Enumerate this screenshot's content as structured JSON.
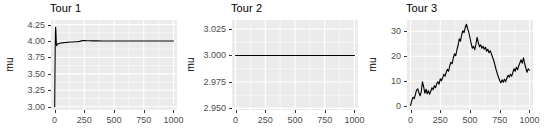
{
  "figure": {
    "width": 546,
    "height": 135,
    "panel_bg": "#ebebeb",
    "grid_color": "#ffffff",
    "line_color": "#000000",
    "text_color": "#000000",
    "tick_text_color": "#4d4d4d"
  },
  "panels": [
    {
      "id": "tour-1",
      "title": "Tour 1",
      "ylabel": "mu",
      "xlabel": "",
      "geom": {
        "left": 51,
        "top": 20,
        "width": 126,
        "height": 90
      },
      "title_left": 50,
      "ylabel_center_x": 9,
      "chart_data": {
        "type": "line",
        "title": "Tour 1",
        "xlabel": "",
        "ylabel": "mu",
        "xlim": [
          -30,
          1030
        ],
        "ylim": [
          2.95,
          4.32
        ],
        "xticks": [
          0,
          250,
          500,
          750,
          1000
        ],
        "xtick_labels": [
          "0",
          "250",
          "500",
          "750",
          "1000"
        ],
        "yticks": [
          3.0,
          3.25,
          3.5,
          3.75,
          4.0,
          4.25
        ],
        "ytick_labels": [
          "3.00",
          "3.25",
          "3.50",
          "3.75",
          "4.00",
          "4.25"
        ],
        "grid": true,
        "minor_grid": true,
        "legend": "none",
        "series": [
          {
            "name": "mu",
            "x": [
              1,
              3,
              5,
              7,
              9,
              11,
              13,
              15,
              18,
              21,
              24,
              27,
              30,
              34,
              38,
              42,
              46,
              50,
              56,
              62,
              70,
              80,
              90,
              100,
              115,
              130,
              150,
              170,
              190,
              210,
              225,
              240,
              255,
              270,
              290,
              320,
              360,
              400,
              450,
              500,
              560,
              620,
              680,
              740,
              800,
              860,
              920,
              970,
              1000
            ],
            "y": [
              3.0,
              3.42,
              3.86,
              4.12,
              4.21,
              4.16,
              4.04,
              3.96,
              3.93,
              3.94,
              3.95,
              3.955,
              3.958,
              3.96,
              3.962,
              3.965,
              3.967,
              3.968,
              3.97,
              3.972,
              3.974,
              3.976,
              3.978,
              3.98,
              3.982,
              3.984,
              3.986,
              3.988,
              3.99,
              3.995,
              4.002,
              4.007,
              4.006,
              4.004,
              4.003,
              4.002,
              4.002,
              4.001,
              4.001,
              4.0,
              4.0,
              4.0,
              4.0,
              4.0,
              4.0,
              4.0,
              4.0,
              4.0,
              4.0
            ]
          }
        ]
      }
    },
    {
      "id": "tour-2",
      "title": "Tour 2",
      "ylabel": "mu",
      "xlabel": "",
      "geom": {
        "left": 232,
        "top": 20,
        "width": 126,
        "height": 90
      },
      "title_left": 231,
      "ylabel_center_x": 190,
      "chart_data": {
        "type": "line",
        "title": "Tour 2",
        "xlabel": "",
        "ylabel": "mu",
        "xlim": [
          -30,
          1030
        ],
        "ylim": [
          2.9485,
          3.0335
        ],
        "xticks": [
          0,
          250,
          500,
          750,
          1000
        ],
        "xtick_labels": [
          "0",
          "250",
          "500",
          "750",
          "1000"
        ],
        "yticks": [
          2.95,
          2.975,
          3.0,
          3.025
        ],
        "ytick_labels": [
          "2.950",
          "2.975",
          "3.000",
          "3.025"
        ],
        "grid": true,
        "minor_grid": true,
        "legend": "none",
        "series": [
          {
            "name": "mu",
            "x": [
              0,
              100,
              200,
              300,
              400,
              500,
              600,
              700,
              800,
              900,
              1000
            ],
            "y": [
              3.0,
              3.0,
              3.0,
              3.0,
              3.0,
              3.0,
              3.0,
              3.0,
              3.0,
              3.0,
              3.0
            ]
          }
        ]
      }
    },
    {
      "id": "tour-3",
      "title": "Tour 3",
      "ylabel": "mu",
      "xlabel": "",
      "geom": {
        "left": 407,
        "top": 20,
        "width": 126,
        "height": 90
      },
      "title_left": 406,
      "ylabel_center_x": 372,
      "chart_data": {
        "type": "line",
        "title": "Tour 3",
        "xlabel": "",
        "ylabel": "mu",
        "xlim": [
          -30,
          1030
        ],
        "ylim": [
          -1.5,
          34.5
        ],
        "xticks": [
          0,
          250,
          500,
          750,
          1000
        ],
        "xtick_labels": [
          "0",
          "250",
          "500",
          "750",
          "1000"
        ],
        "yticks": [
          0,
          10,
          20,
          30
        ],
        "ytick_labels": [
          "0",
          "10",
          "20",
          "30"
        ],
        "grid": true,
        "minor_grid": true,
        "legend": "none",
        "series": [
          {
            "name": "mu",
            "x": [
              0,
              10,
              20,
              30,
              40,
              50,
              60,
              70,
              80,
              90,
              100,
              110,
              120,
              130,
              140,
              150,
              160,
              170,
              180,
              190,
              200,
              210,
              220,
              230,
              240,
              250,
              260,
              270,
              280,
              290,
              300,
              310,
              320,
              330,
              340,
              350,
              360,
              370,
              380,
              390,
              400,
              410,
              420,
              430,
              440,
              450,
              460,
              470,
              480,
              490,
              500,
              510,
              520,
              530,
              540,
              550,
              560,
              570,
              580,
              590,
              600,
              610,
              620,
              630,
              640,
              650,
              660,
              670,
              680,
              690,
              700,
              710,
              720,
              730,
              740,
              750,
              760,
              770,
              780,
              790,
              800,
              810,
              820,
              830,
              840,
              850,
              860,
              870,
              880,
              890,
              900,
              910,
              920,
              930,
              940,
              950,
              960,
              970,
              980,
              990,
              1000
            ],
            "y": [
              0.3,
              2.2,
              3.6,
              3.0,
              4.6,
              6.4,
              7.0,
              5.4,
              4.2,
              5.8,
              9.8,
              7.8,
              5.2,
              6.8,
              5.0,
              6.2,
              4.8,
              6.0,
              7.4,
              6.6,
              8.2,
              7.4,
              9.0,
              9.8,
              8.8,
              11.0,
              10.2,
              11.4,
              12.8,
              12.0,
              13.6,
              14.8,
              14.0,
              16.2,
              17.6,
              17.0,
              19.4,
              21.0,
              20.2,
              22.6,
              24.4,
              27.0,
              26.0,
              28.6,
              30.2,
              29.4,
              31.6,
              32.8,
              31.0,
              29.6,
              27.4,
              25.0,
              23.2,
              24.0,
              22.6,
              24.8,
              27.6,
              25.4,
              23.8,
              24.6,
              23.2,
              24.0,
              22.8,
              23.6,
              22.0,
              22.8,
              21.4,
              22.2,
              21.0,
              19.6,
              18.2,
              16.4,
              14.6,
              13.0,
              11.6,
              10.2,
              9.4,
              10.6,
              9.6,
              10.8,
              9.8,
              11.2,
              12.4,
              11.6,
              12.8,
              12.0,
              13.4,
              15.0,
              14.0,
              15.6,
              14.6,
              16.2,
              17.4,
              18.6,
              17.2,
              19.4,
              17.0,
              15.2,
              13.6,
              15.0,
              14.4
            ]
          }
        ]
      }
    }
  ]
}
